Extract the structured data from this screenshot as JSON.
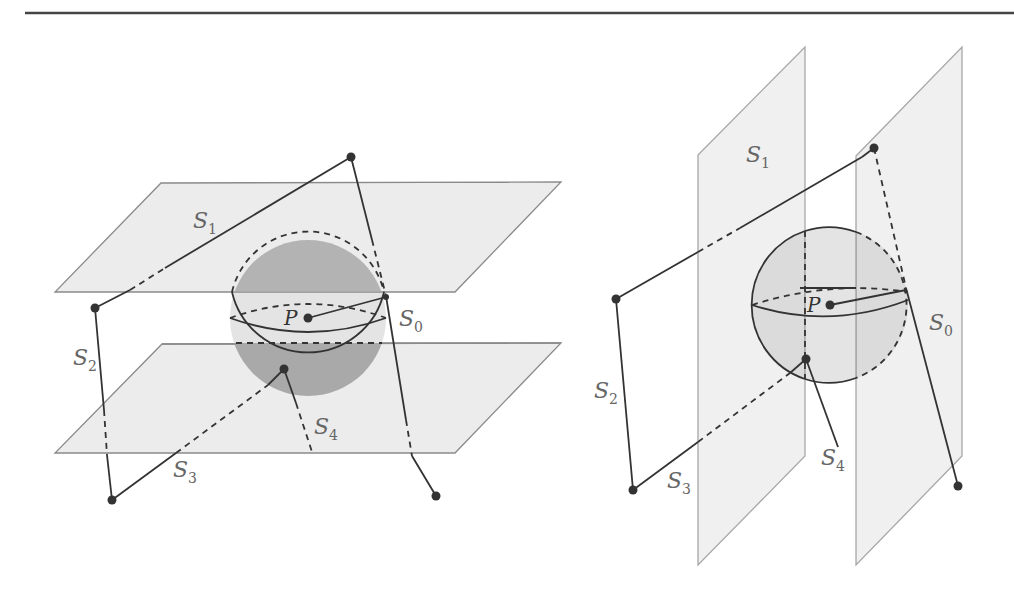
{
  "figure": {
    "left_panel": {
      "description": "Sphere centered at P between two horizontal planes",
      "labels": {
        "S1": {
          "base": "S",
          "sub": "1"
        },
        "S0": {
          "base": "S",
          "sub": "0"
        },
        "S2": {
          "base": "S",
          "sub": "2"
        },
        "S3": {
          "base": "S",
          "sub": "3"
        },
        "S4": {
          "base": "S",
          "sub": "4"
        },
        "P": "P"
      }
    },
    "right_panel": {
      "description": "Sphere centered at P between two vertical planes",
      "labels": {
        "S1": {
          "base": "S",
          "sub": "1"
        },
        "S0": {
          "base": "S",
          "sub": "0"
        },
        "S2": {
          "base": "S",
          "sub": "2"
        },
        "S3": {
          "base": "S",
          "sub": "3"
        },
        "S4": {
          "base": "S",
          "sub": "4"
        },
        "P": "P"
      }
    },
    "colors": {
      "plane_fill": "#ececec",
      "sphere_shade": "#a9a9a9",
      "line": "#333333",
      "label": "#666666"
    }
  }
}
